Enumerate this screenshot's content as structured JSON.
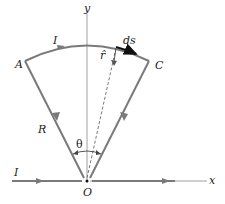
{
  "diagram": {
    "type": "circuit-geometry",
    "labels": {
      "y_axis": "y",
      "x_axis": "x",
      "current_top": "I",
      "current_left": "I",
      "point_a": "A",
      "point_c": "C",
      "origin": "O",
      "radius": "R",
      "angle": "θ",
      "ds": "ds",
      "r_hat": "r̂"
    },
    "colors": {
      "wire": "#7a7a7a",
      "axis": "#888888",
      "ds_arrow": "#111111",
      "text": "#222222"
    }
  }
}
